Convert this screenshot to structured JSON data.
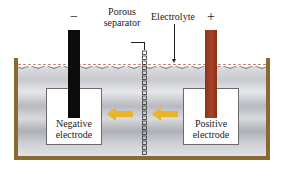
{
  "figure": {
    "electrodes": {
      "negative": {
        "sign": "−",
        "label_line1": "Negative",
        "label_line2": "electrode",
        "color": "#0b0b0b"
      },
      "positive": {
        "sign": "+",
        "label_line1": "Positive",
        "label_line2": "electrode",
        "color": "#a03c22"
      }
    },
    "labels": {
      "porous_line1": "Porous",
      "porous_line2": "separator",
      "electrolyte": "Electrolyte"
    },
    "arrows": [
      {
        "direction": "left",
        "position": "between-negative-and-separator"
      },
      {
        "direction": "left",
        "position": "between-separator-and-positive"
      }
    ],
    "colors": {
      "tank_wall": "#8a6a34",
      "arrow": "#e8b52a",
      "surface_dash": "#c58a7a"
    }
  }
}
